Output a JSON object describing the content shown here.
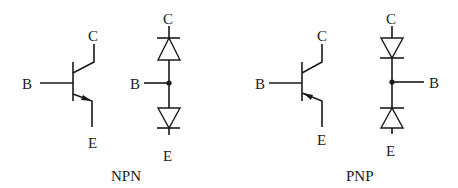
{
  "diagram": {
    "npn": {
      "caption": "NPN",
      "transistor": {
        "base": "B",
        "collector": "C",
        "emitter": "E"
      },
      "diode_model": {
        "base": "B",
        "collector": "C",
        "emitter": "E"
      }
    },
    "pnp": {
      "caption": "PNP",
      "transistor": {
        "base": "B",
        "collector": "C",
        "emitter": "E"
      },
      "diode_model": {
        "base": "B",
        "collector": "C",
        "emitter": "E"
      }
    }
  }
}
